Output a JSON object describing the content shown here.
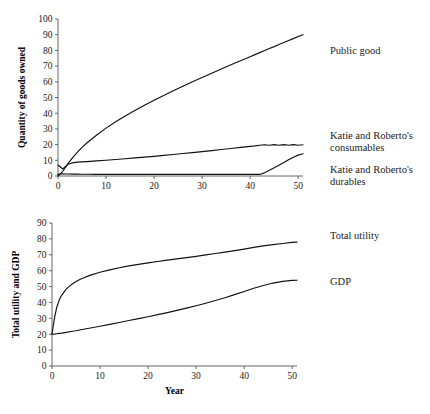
{
  "figure": {
    "background": "#ffffff",
    "line_color": "#111111",
    "axis_color": "#555555",
    "text_color": "#1a1a1a"
  },
  "panels": [
    {
      "id": "top",
      "ylabel": "Quantity of goods owned",
      "xlabel": "",
      "labels": [
        {
          "name": "public-good",
          "text": "Public good",
          "x": 330,
          "y": 45
        },
        {
          "name": "consumables",
          "text": "Katie and Roberto's\nconsumables",
          "x": 330,
          "y": 134
        },
        {
          "name": "durables",
          "text": "Katie and Roberto's\ndurables",
          "x": 330,
          "y": 168
        }
      ]
    },
    {
      "id": "bottom",
      "ylabel": "Total utility and GDP",
      "xlabel": "Year",
      "labels": [
        {
          "name": "total-utility",
          "text": "Total utility",
          "x": 330,
          "y": 26
        },
        {
          "name": "gdp",
          "text": "GDP",
          "x": 330,
          "y": 72
        }
      ]
    }
  ],
  "chart_data": [
    {
      "type": "line",
      "id": "top-panel",
      "title": "",
      "xlabel": "",
      "ylabel": "Quantity of goods owned",
      "xlim": [
        0,
        51
      ],
      "ylim": [
        0,
        100
      ],
      "xticks": [
        0,
        10,
        20,
        30,
        40,
        50
      ],
      "yticks": [
        0,
        10,
        20,
        30,
        40,
        50,
        60,
        70,
        80,
        90,
        100
      ],
      "grid": false,
      "legend_position": "right-inline",
      "x": [
        0,
        1,
        2,
        3,
        4,
        5,
        6,
        8,
        10,
        12,
        14,
        16,
        18,
        20,
        22,
        24,
        26,
        28,
        30,
        32,
        34,
        36,
        38,
        40,
        41,
        42,
        43,
        44,
        45,
        46,
        47,
        48,
        49,
        50,
        51
      ],
      "series": [
        {
          "name": "Public good",
          "values": [
            0,
            3.0,
            7.5,
            11.5,
            15.0,
            18.2,
            21.0,
            26.0,
            30.5,
            34.5,
            38.2,
            41.7,
            45.0,
            48.2,
            51.3,
            54.3,
            57.2,
            60.0,
            62.8,
            65.5,
            68.2,
            70.8,
            73.4,
            76.0,
            77.3,
            78.6,
            79.9,
            81.2,
            82.4,
            83.7,
            85.0,
            86.3,
            87.5,
            88.8,
            90.0
          ]
        },
        {
          "name": "Katie and Roberto's consumables",
          "values": [
            7.0,
            4.5,
            7.3,
            8.4,
            8.8,
            9.0,
            9.2,
            9.6,
            10.0,
            10.5,
            11.0,
            11.5,
            12.0,
            12.5,
            13.1,
            13.7,
            14.3,
            14.9,
            15.5,
            16.2,
            16.9,
            17.5,
            18.2,
            18.9,
            19.2,
            19.6,
            19.9,
            19.6,
            20.0,
            19.6,
            20.0,
            19.6,
            20.0,
            19.6,
            19.9
          ]
        },
        {
          "name": "Katie and Roberto's durables",
          "values": [
            1.0,
            1.4,
            1.3,
            1.2,
            1.2,
            1.1,
            1.1,
            1.0,
            1.0,
            1.0,
            1.0,
            1.0,
            1.0,
            1.0,
            1.0,
            1.0,
            1.0,
            1.0,
            1.0,
            1.0,
            1.0,
            1.0,
            1.0,
            1.0,
            1.0,
            1.0,
            2.0,
            3.6,
            5.2,
            6.9,
            8.6,
            10.3,
            12.0,
            13.3,
            14.2
          ]
        }
      ]
    },
    {
      "type": "line",
      "id": "bottom-panel",
      "title": "",
      "xlabel": "Year",
      "ylabel": "Total utility and GDP",
      "xlim": [
        0,
        51
      ],
      "ylim": [
        0,
        90
      ],
      "xticks": [
        0,
        10,
        20,
        30,
        40,
        50
      ],
      "yticks": [
        0,
        10,
        20,
        30,
        40,
        50,
        60,
        70,
        80,
        90
      ],
      "grid": false,
      "legend_position": "right-inline",
      "x": [
        0,
        0.5,
        1,
        1.5,
        2,
        3,
        4,
        5,
        6,
        8,
        10,
        12,
        14,
        16,
        18,
        20,
        22,
        24,
        26,
        28,
        30,
        32,
        34,
        36,
        38,
        40,
        42,
        44,
        46,
        48,
        50,
        51
      ],
      "series": [
        {
          "name": "Total utility",
          "values": [
            20.0,
            30.0,
            37.0,
            41.5,
            44.5,
            48.5,
            51.2,
            53.2,
            54.8,
            57.2,
            59.0,
            60.5,
            61.8,
            63.0,
            64.0,
            64.9,
            65.8,
            66.6,
            67.4,
            68.2,
            69.0,
            69.9,
            70.8,
            71.7,
            72.6,
            73.6,
            74.7,
            75.6,
            76.4,
            77.1,
            77.8,
            78.0
          ]
        },
        {
          "name": "GDP",
          "values": [
            20.0,
            20.1,
            20.3,
            20.5,
            20.7,
            21.2,
            21.7,
            22.2,
            22.8,
            23.9,
            25.0,
            26.2,
            27.4,
            28.6,
            29.8,
            31.0,
            32.3,
            33.6,
            35.0,
            36.4,
            37.9,
            39.5,
            41.2,
            43.0,
            44.9,
            46.9,
            48.9,
            50.7,
            52.2,
            53.3,
            53.9,
            54.0
          ]
        }
      ]
    }
  ]
}
